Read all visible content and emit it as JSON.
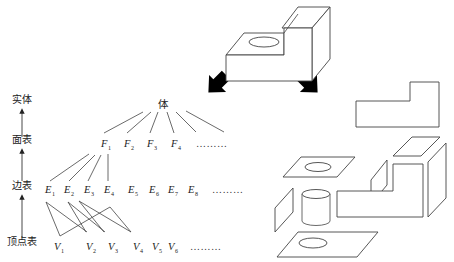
{
  "diagram": {
    "title": "",
    "levels": [
      {
        "id": "solid",
        "label": "实体",
        "x": 22,
        "y": 103
      },
      {
        "id": "face_table",
        "label": "面表",
        "x": 22,
        "y": 143
      },
      {
        "id": "edge_table",
        "label": "边表",
        "x": 22,
        "y": 189
      },
      {
        "id": "vertex_table",
        "label": "顶点表",
        "x": 22,
        "y": 245
      }
    ],
    "root": {
      "label": "体",
      "x": 163,
      "y": 108
    },
    "faces": {
      "items": [
        {
          "base": "F",
          "sub": "1",
          "x": 101,
          "y": 147
        },
        {
          "base": "F",
          "sub": "2",
          "x": 124,
          "y": 147
        },
        {
          "base": "F",
          "sub": "3",
          "x": 147,
          "y": 147
        },
        {
          "base": "F",
          "sub": "4",
          "x": 171,
          "y": 147
        }
      ],
      "ellipsis": "………",
      "ellipsis_x": 196,
      "ellipsis_y": 147
    },
    "edges": {
      "items": [
        {
          "base": "E",
          "sub": "1",
          "x": 45,
          "y": 193
        },
        {
          "base": "E",
          "sub": "2",
          "x": 64,
          "y": 193
        },
        {
          "base": "E",
          "sub": "3",
          "x": 84,
          "y": 193
        },
        {
          "base": "E",
          "sub": "4",
          "x": 104,
          "y": 193
        },
        {
          "base": "E",
          "sub": "5",
          "x": 128,
          "y": 193
        },
        {
          "base": "E",
          "sub": "6",
          "x": 149,
          "y": 193
        },
        {
          "base": "E",
          "sub": "7",
          "x": 168,
          "y": 193
        },
        {
          "base": "E",
          "sub": "8",
          "x": 188,
          "y": 193
        }
      ],
      "ellipsis": "………",
      "ellipsis_x": 212,
      "ellipsis_y": 193
    },
    "vertices": {
      "items": [
        {
          "base": "V",
          "sub": "1",
          "x": 54,
          "y": 250
        },
        {
          "base": "V",
          "sub": "2",
          "x": 86,
          "y": 250
        },
        {
          "base": "V",
          "sub": "3",
          "x": 108,
          "y": 250
        },
        {
          "base": "V",
          "sub": "4",
          "x": 133,
          "y": 250
        },
        {
          "base": "V",
          "sub": "5",
          "x": 152,
          "y": 250
        },
        {
          "base": "V",
          "sub": "6",
          "x": 168,
          "y": 250
        }
      ],
      "ellipsis": "………",
      "ellipsis_x": 190,
      "ellipsis_y": 250
    },
    "root_links": [
      [
        143,
        112,
        104,
        133
      ],
      [
        151,
        112,
        127,
        133
      ],
      [
        158,
        112,
        150,
        133
      ],
      [
        167,
        112,
        174,
        133
      ],
      [
        176,
        112,
        196,
        132
      ],
      [
        186,
        111,
        224,
        132
      ]
    ],
    "face_edge_links": [
      [
        89,
        154,
        50,
        181
      ],
      [
        95,
        155,
        69,
        181
      ],
      [
        101,
        155,
        88,
        181
      ],
      [
        108,
        154,
        108,
        181
      ]
    ],
    "edge_vertex_links": [
      [
        46,
        202,
        60,
        236
      ],
      [
        46,
        202,
        87,
        232
      ],
      [
        60,
        236,
        110,
        207
      ],
      [
        68,
        202,
        86,
        232
      ],
      [
        68,
        202,
        105,
        232
      ],
      [
        79,
        201,
        104,
        232
      ],
      [
        79,
        201,
        131,
        232
      ],
      [
        110,
        207,
        131,
        232
      ]
    ],
    "level_arrows": [
      [
        22,
        137,
        22,
        111
      ],
      [
        22,
        181,
        22,
        151
      ],
      [
        22,
        238,
        22,
        197
      ]
    ],
    "big_arrows": [
      {
        "name": "arrow-to-tree",
        "x": 219,
        "y": 82,
        "rotate": 45
      },
      {
        "name": "arrow-to-parts",
        "x": 307,
        "y": 82,
        "rotate": -45
      }
    ],
    "solid_view": {
      "caption": ""
    },
    "exploded_view": {
      "caption": ""
    },
    "colors": {
      "stroke": "#333333",
      "arrow": "#000000",
      "background": "#ffffff"
    }
  }
}
